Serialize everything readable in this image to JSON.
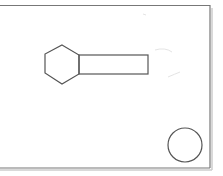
{
  "diagram": {
    "type": "technical-sketch",
    "background": "#ffffff",
    "stroke_color": "#555555",
    "frame": {
      "label": "drawing-frame"
    },
    "shapes": [
      {
        "name": "bolt-head-hexagon",
        "kind": "hexagon"
      },
      {
        "name": "bolt-shank-rectangle",
        "kind": "rectangle"
      },
      {
        "name": "circle",
        "kind": "circle"
      }
    ]
  }
}
